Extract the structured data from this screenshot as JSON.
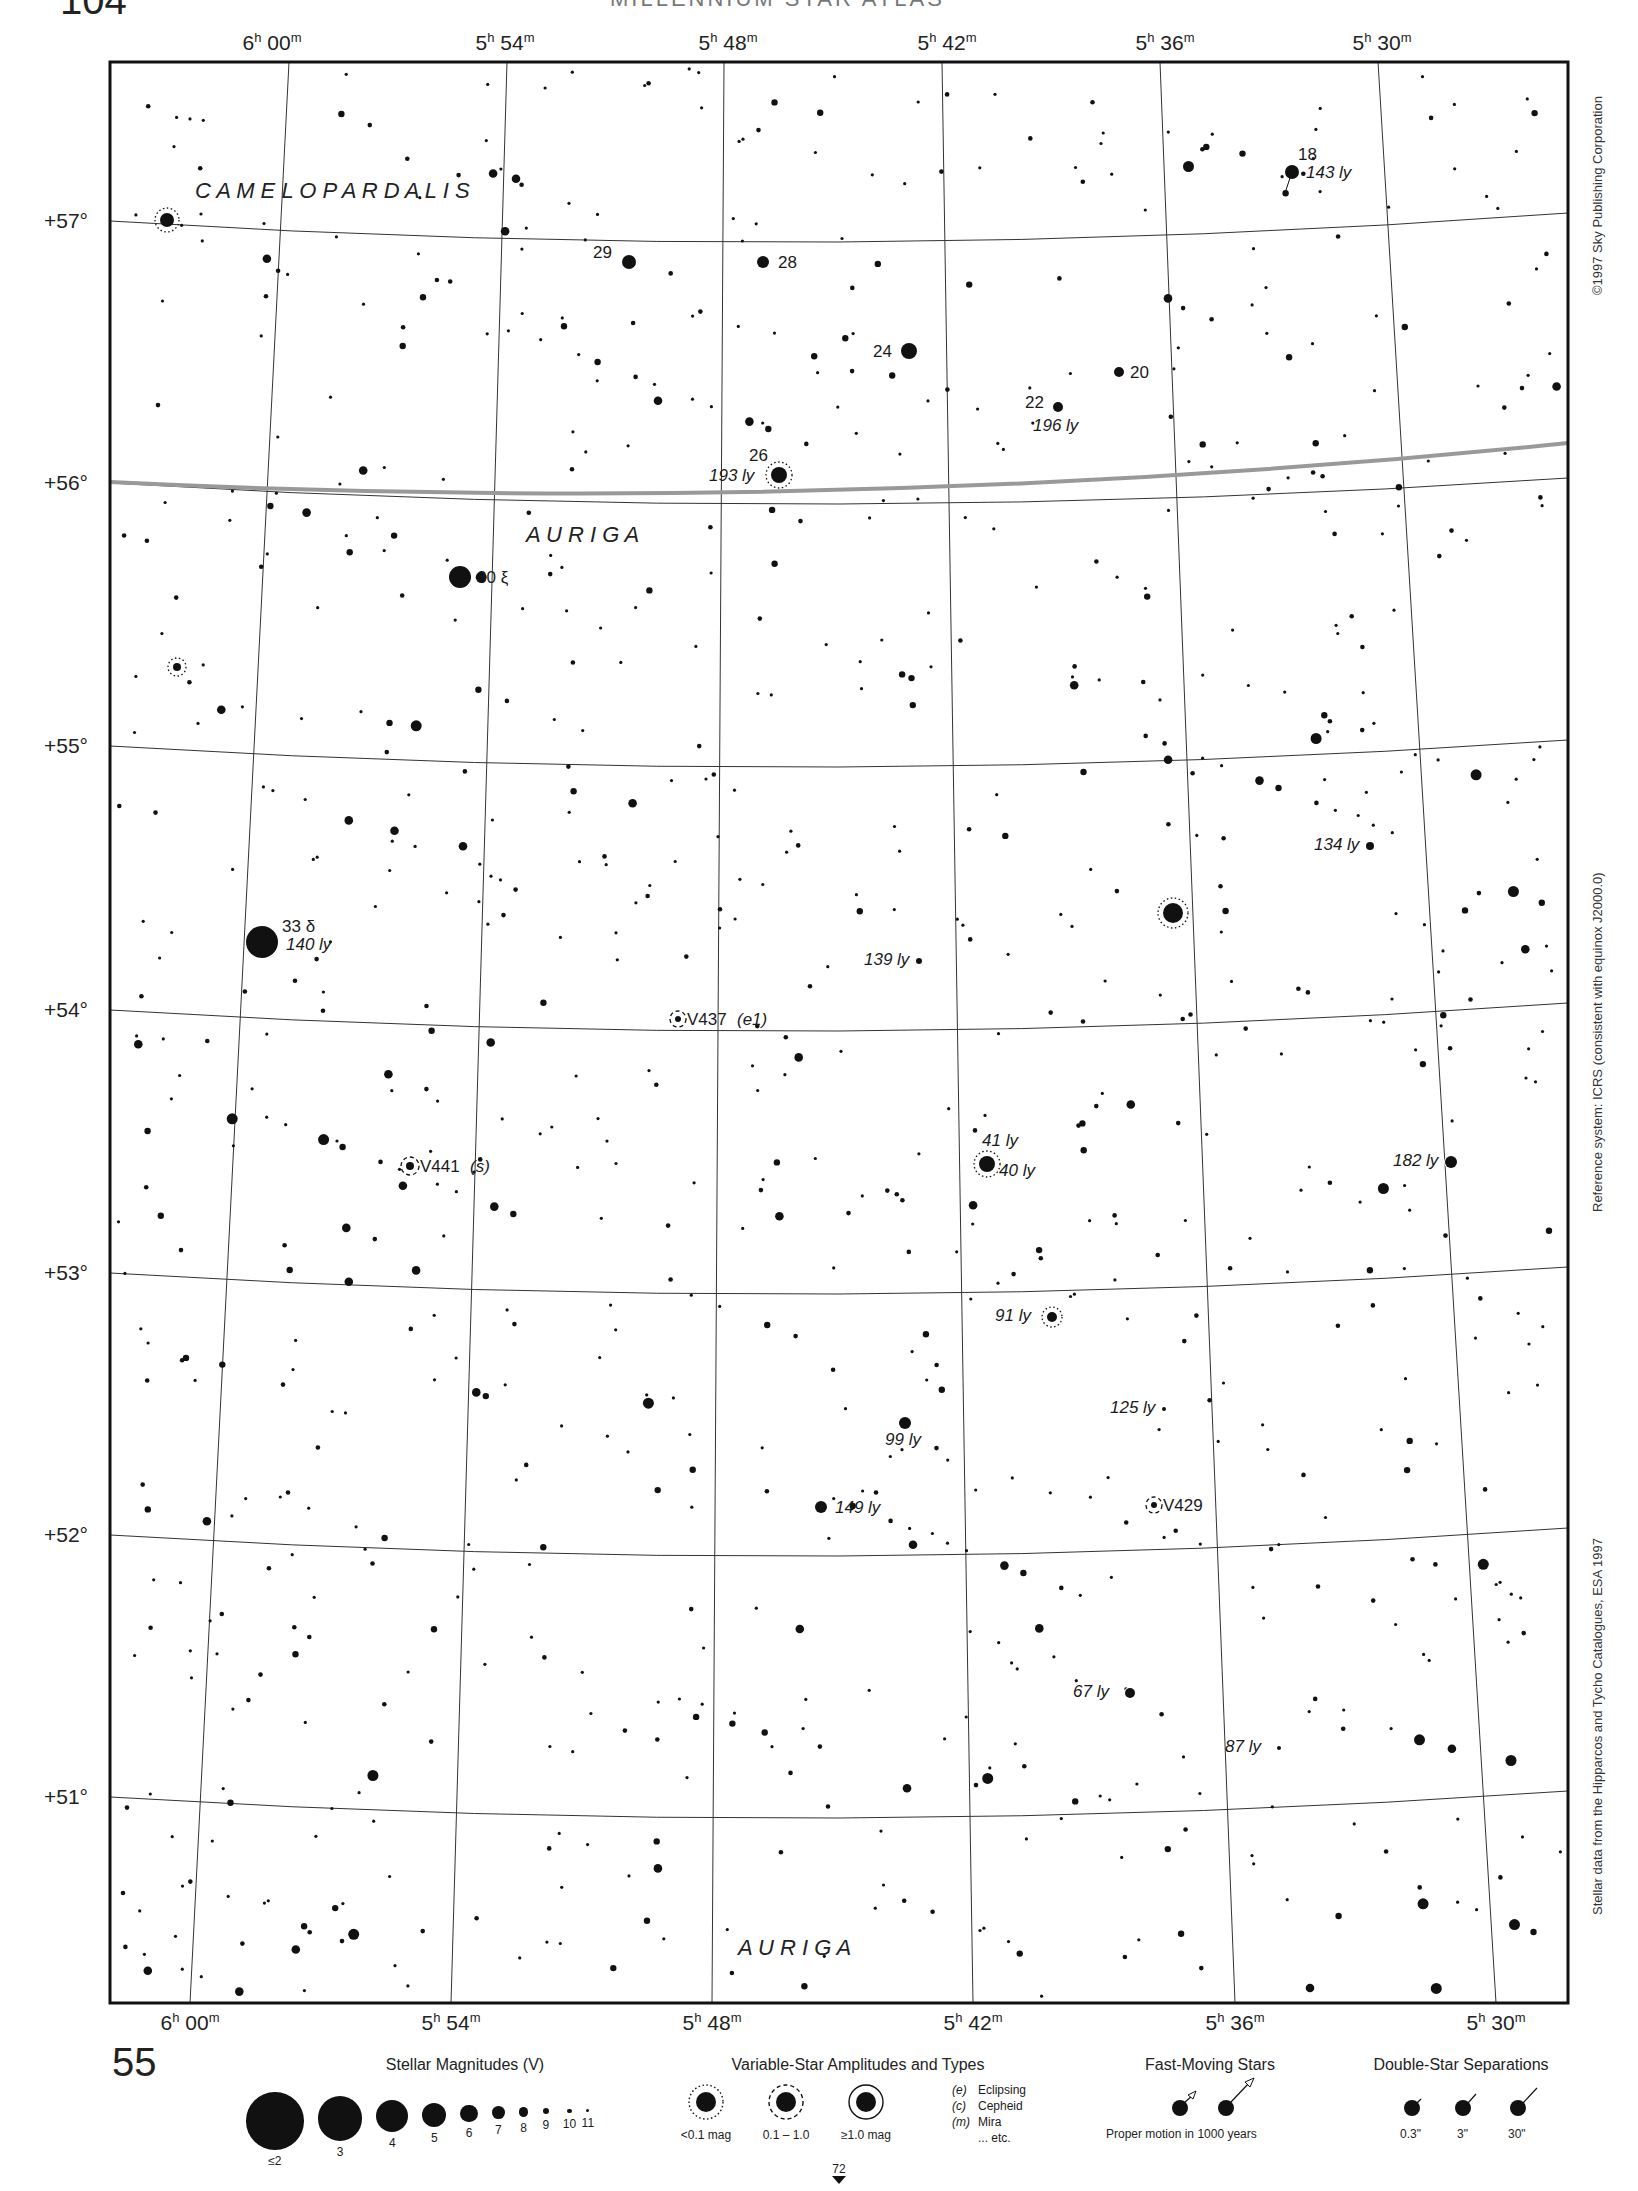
{
  "page": {
    "top_page_number": "104",
    "running_head": "MILLENNIUM STAR ATLAS",
    "bottom_chart_number": "55",
    "adjacent_chart_below": "72"
  },
  "chart_data": {
    "type": "star_chart",
    "frame": {
      "left": 110,
      "top": 62,
      "right": 1568,
      "bottom": 2003
    },
    "ra_labels_top": [
      {
        "label": "6h 00m",
        "h": "6",
        "m": "00",
        "x": 272
      },
      {
        "label": "5h 54m",
        "h": "5",
        "m": "54",
        "x": 505
      },
      {
        "label": "5h 48m",
        "h": "5",
        "m": "48",
        "x": 728
      },
      {
        "label": "5h 42m",
        "h": "5",
        "m": "42",
        "x": 947
      },
      {
        "label": "5h 36m",
        "h": "5",
        "m": "36",
        "x": 1165
      },
      {
        "label": "5h 30m",
        "h": "5",
        "m": "30",
        "x": 1382
      }
    ],
    "ra_labels_bottom": [
      {
        "label": "6h 00m",
        "h": "6",
        "m": "00",
        "x": 190
      },
      {
        "label": "5h 54m",
        "h": "5",
        "m": "54",
        "x": 451
      },
      {
        "label": "5h 48m",
        "h": "5",
        "m": "48",
        "x": 712
      },
      {
        "label": "5h 42m",
        "h": "5",
        "m": "42",
        "x": 973
      },
      {
        "label": "5h 36m",
        "h": "5",
        "m": "36",
        "x": 1235
      },
      {
        "label": "5h 30m",
        "h": "5",
        "m": "30",
        "x": 1496
      }
    ],
    "ra_lines": [
      {
        "x_top": 289,
        "x_bottom": 190
      },
      {
        "x_top": 507,
        "x_bottom": 451
      },
      {
        "x_top": 724,
        "x_bottom": 712
      },
      {
        "x_top": 942,
        "x_bottom": 973
      },
      {
        "x_top": 1160,
        "x_bottom": 1235
      },
      {
        "x_top": 1378,
        "x_bottom": 1496
      }
    ],
    "dec_labels": [
      {
        "label": "+57°",
        "y": 221
      },
      {
        "label": "+56°",
        "y": 483
      },
      {
        "label": "+55°",
        "y": 746
      },
      {
        "label": "+54°",
        "y": 1010
      },
      {
        "label": "+53°",
        "y": 1273
      },
      {
        "label": "+52°",
        "y": 1535
      },
      {
        "label": "+51°",
        "y": 1797
      }
    ],
    "dec_lines": [
      {
        "y_left": 221,
        "y_mid": 242,
        "y_right": 213
      },
      {
        "y_left": 483,
        "y_mid": 504,
        "y_right": 478
      },
      {
        "y_left": 746,
        "y_mid": 767,
        "y_right": 740
      },
      {
        "y_left": 1010,
        "y_mid": 1031,
        "y_right": 1003
      },
      {
        "y_left": 1273,
        "y_mid": 1294,
        "y_right": 1267
      },
      {
        "y_left": 1535,
        "y_mid": 1556,
        "y_right": 1528
      },
      {
        "y_left": 1797,
        "y_mid": 1818,
        "y_right": 1791
      }
    ],
    "constellation_boundary": {
      "y_left": 484,
      "y_mid": 492,
      "y_right": 445
    },
    "constellation_labels": [
      {
        "name": "C A M E L O P A R D A L I S",
        "x": 195,
        "y": 198
      },
      {
        "name": "A U R I G A",
        "x": 526,
        "y": 542
      },
      {
        "name": "A U R I G A",
        "x": 738,
        "y": 1955
      }
    ],
    "labeled_stars": [
      {
        "id": "18",
        "x": 1292,
        "y": 172,
        "r": 7,
        "label": "18",
        "dist": "143 ly",
        "pm": {
          "dx": -8,
          "dy": 24
        }
      },
      {
        "id": "29",
        "x": 629,
        "y": 262,
        "r": 7,
        "label": "29",
        "lx": 593,
        "ly": 258
      },
      {
        "id": "28",
        "x": 763,
        "y": 262,
        "r": 6,
        "label": "28",
        "lx": 778,
        "ly": 268
      },
      {
        "id": "24",
        "x": 909,
        "y": 351,
        "r": 8,
        "label": "24",
        "lx": 873,
        "ly": 357
      },
      {
        "id": "20",
        "x": 1119,
        "y": 372,
        "r": 5,
        "label": "20",
        "lx": 1130,
        "ly": 378
      },
      {
        "id": "22",
        "x": 1058,
        "y": 407,
        "r": 5,
        "label": "22",
        "dist": "196 ly",
        "lx": 1025,
        "ly": 408
      },
      {
        "id": "26",
        "x": 779,
        "y": 475,
        "r": 8,
        "variable": "dotted",
        "label": "26",
        "dist": "193 ly"
      },
      {
        "id": "30 xi",
        "x": 460,
        "y": 577,
        "r": 11,
        "label": "30 ξ"
      },
      {
        "id": "33 delta",
        "x": 262,
        "y": 942,
        "r": 16,
        "label": "33 δ",
        "dist": "140 ly"
      },
      {
        "id": "V437",
        "x": 678,
        "y": 1019,
        "r": 3,
        "variable": "dashed",
        "label": "V437",
        "type": "(e1)"
      },
      {
        "id": "V441",
        "x": 410,
        "y": 1166,
        "r": 4,
        "variable": "dashed",
        "label": "V441",
        "type": "(s)"
      },
      {
        "id": "41/40 ly",
        "x": 987,
        "y": 1164,
        "r": 8,
        "variable": "dotted",
        "dist_a": "41 ly",
        "dist_b": "40 ly"
      },
      {
        "id": "182 ly",
        "x": 1451,
        "y": 1162,
        "r": 6,
        "dist": "182 ly"
      },
      {
        "id": "134 ly",
        "x": 1370,
        "y": 846,
        "r": 4,
        "dist": "134 ly"
      },
      {
        "id": "139 ly",
        "x": 919,
        "y": 961,
        "r": 3,
        "dist": "139 ly"
      },
      {
        "id": "91 ly",
        "x": 1052,
        "y": 1317,
        "r": 5,
        "variable": "dotted",
        "dist": "91 ly"
      },
      {
        "id": "125 ly",
        "x": 1164,
        "y": 1409,
        "r": 2,
        "dist": "125 ly"
      },
      {
        "id": "99 ly",
        "x": 905,
        "y": 1423,
        "r": 6,
        "dist": "99 ly"
      },
      {
        "id": "149 ly",
        "x": 821,
        "y": 1507,
        "r": 6,
        "dist": "149 ly"
      },
      {
        "id": "V429",
        "x": 1154,
        "y": 1505,
        "r": 3,
        "variable": "dashed",
        "label": "V429"
      },
      {
        "id": "67 ly",
        "x": 1130,
        "y": 1693,
        "r": 5,
        "dist": "67 ly"
      },
      {
        "id": "87 ly",
        "x": 1279,
        "y": 1748,
        "r": 2,
        "dist": "87 ly"
      }
    ],
    "unlabeled_variable_stars": [
      {
        "x": 167,
        "y": 220,
        "r": 7,
        "style": "dotted"
      },
      {
        "x": 177,
        "y": 667,
        "r": 4,
        "style": "dotted"
      },
      {
        "x": 1173,
        "y": 913,
        "r": 10,
        "style": "dotted"
      }
    ]
  },
  "side_notes": {
    "copyright": "©1997 Sky Publishing Corporation",
    "reference": "Reference system: ICRS (consistent with equinox J2000.0)",
    "data_source": "Stellar data from the Hipparcos and Tycho Catalogues, ESA 1997"
  },
  "legend": {
    "magnitudes": {
      "title": "Stellar Magnitudes (V)",
      "items": [
        {
          "label": "≤2",
          "size": 36
        },
        {
          "label": "3",
          "size": 28
        },
        {
          "label": "4",
          "size": 20
        },
        {
          "label": "5",
          "size": 15
        },
        {
          "label": "6",
          "size": 11
        },
        {
          "label": "7",
          "size": 8
        },
        {
          "label": "8",
          "size": 6
        },
        {
          "label": "9",
          "size": 4
        },
        {
          "label": "10",
          "size": 3
        },
        {
          "label": "11",
          "size": 2
        }
      ]
    },
    "variables": {
      "title": "Variable-Star Amplitudes and Types",
      "amplitudes": [
        {
          "label": "<0.1 mag",
          "style": "dotted"
        },
        {
          "label": "0.1 – 1.0",
          "style": "dashed"
        },
        {
          "label": "≥1.0 mag",
          "style": "solid"
        }
      ],
      "types": [
        {
          "abbr": "(e)",
          "name": "Eclipsing"
        },
        {
          "abbr": "(c)",
          "name": "Cepheid"
        },
        {
          "abbr": "(m)",
          "name": "Mira"
        },
        {
          "abbr": "",
          "name": "... etc."
        }
      ]
    },
    "fast_moving": {
      "title": "Fast-Moving Stars",
      "caption": "Proper motion in 1000 years"
    },
    "doubles": {
      "title": "Double-Star Separations",
      "items": [
        {
          "label": "0.3\""
        },
        {
          "label": "3\""
        },
        {
          "label": "30\""
        }
      ]
    }
  }
}
